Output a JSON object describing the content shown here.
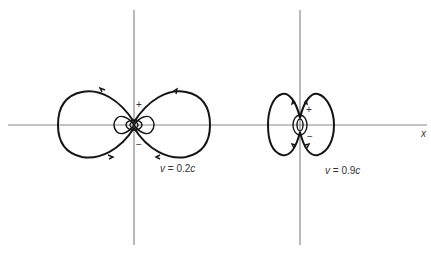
{
  "diagram": {
    "type": "field-lines",
    "axis_x_label": "x",
    "panels": [
      {
        "id": "slow",
        "velocity_label": "v = 0.2c",
        "velocity_var": "v",
        "velocity_eq": " = 0.2",
        "velocity_unit": "c",
        "plus": "+",
        "minus": "−"
      },
      {
        "id": "fast",
        "velocity_label": "v = 0.9c",
        "velocity_var": "v",
        "velocity_eq": " = 0.9",
        "velocity_unit": "c",
        "plus": "+",
        "minus": "−"
      }
    ]
  },
  "colors": {
    "axis": "#8a8a8a",
    "curve": "#151515",
    "background": "#ffffff"
  }
}
